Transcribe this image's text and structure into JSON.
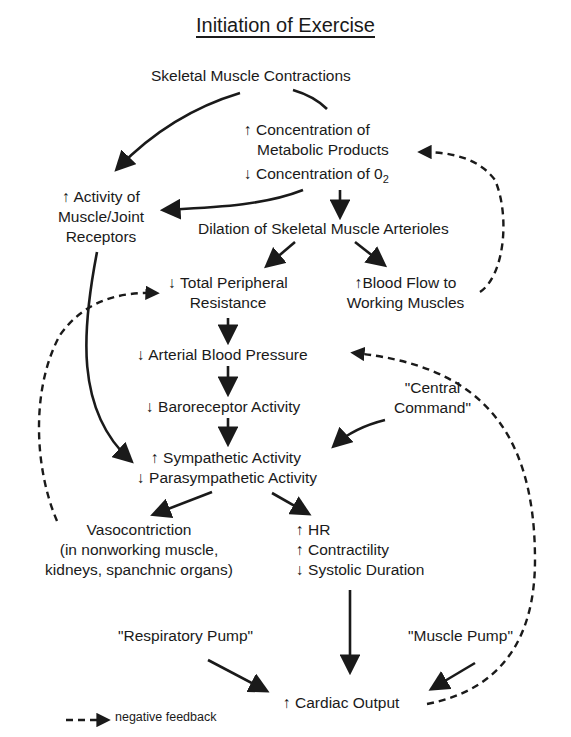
{
  "title": "Initiation of Exercise",
  "nodes": {
    "skeletal_contractions": "Skeletal Muscle Contractions",
    "metabolic_1": "↑ Concentration of",
    "metabolic_2": "Metabolic Products",
    "o2": "↓ Concentration of 0",
    "o2_sub": "2",
    "receptors_1": "↑ Activity of",
    "receptors_2": "Muscle/Joint",
    "receptors_3": "Receptors",
    "dilation": "Dilation of Skeletal Muscle Arterioles",
    "tpr_1": "↓ Total Peripheral",
    "tpr_2": "Resistance",
    "bloodflow_1": "↑Blood Flow to",
    "bloodflow_2": "Working Muscles",
    "abp": "↓ Arterial Blood Pressure",
    "baroreceptor": "↓ Baroreceptor Activity",
    "central_1": "\"Central",
    "central_2": "Command\"",
    "sympathetic": "↑ Sympathetic Activity",
    "parasympathetic": "↓ Parasympathetic Activity",
    "vaso_1": "Vasocontriction",
    "vaso_2": "(in nonworking muscle,",
    "vaso_3": "kidneys, spanchnic organs)",
    "hr": "↑ HR",
    "contractility": "↑ Contractility",
    "systolic": "↓ Systolic Duration",
    "resp_pump": "\"Respiratory Pump\"",
    "muscle_pump": "\"Muscle Pump\"",
    "cardiac_output": "↑ Cardiac Output"
  },
  "legend": {
    "label": "negative feedback"
  },
  "colors": {
    "ink": "#1a1a1a",
    "background": "#ffffff"
  }
}
